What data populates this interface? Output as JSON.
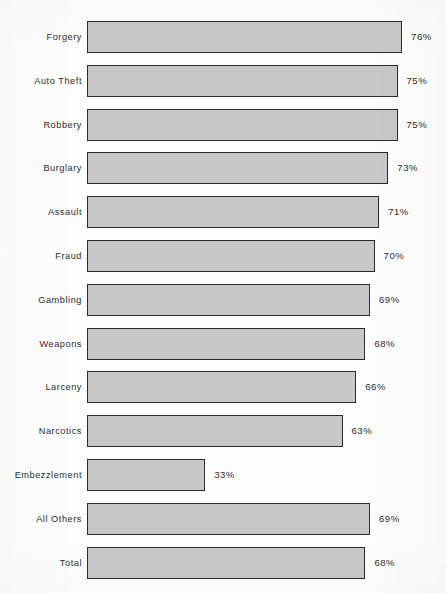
{
  "chart_data": {
    "type": "bar",
    "orientation": "horizontal",
    "title": "",
    "subtitle": "",
    "xlabel": "",
    "ylabel": "",
    "grid": false,
    "legend": null,
    "value_suffix": "%",
    "xlim": [
      0,
      100
    ],
    "categories": [
      "Forgery",
      "Auto Theft",
      "Robbery",
      "Burglary",
      "Assault",
      "Fraud",
      "Gambling",
      "Weapons",
      "Larceny",
      "Narcotics",
      "Embezzlement",
      "All Others",
      "Total"
    ],
    "values": [
      76,
      75,
      75,
      73,
      71,
      70,
      69,
      68,
      66,
      63,
      33,
      69,
      68
    ],
    "value_labels": [
      "76%",
      "75%",
      "75%",
      "73%",
      "71%",
      "70%",
      "69%",
      "68%",
      "66%",
      "63%",
      "33%",
      "69%",
      "68%"
    ],
    "bar_fill_color": "#c8c8c8",
    "bar_border_color": "#2b2b2b",
    "text_color": "#2c2c2c",
    "background_color": "#fdfdfd"
  },
  "layout": {
    "bar_left_px": 87,
    "bar_height_px": 32,
    "row_pitch_px": 43.8,
    "first_row_top_px": 21,
    "px_per_percent": 4.58,
    "px_offset": -33,
    "value_gap_px": 9
  }
}
